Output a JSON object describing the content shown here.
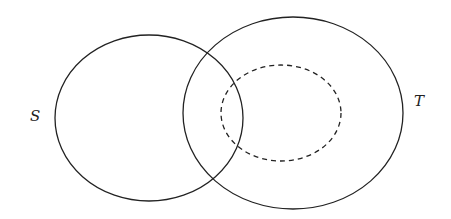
{
  "diagram": {
    "type": "venn",
    "sets": [
      {
        "id": "S",
        "label": "S",
        "style": "solid",
        "cx": 149,
        "cy": 118,
        "rx": 94,
        "ry": 83
      },
      {
        "id": "T",
        "label": "T",
        "style": "solid",
        "cx": 293,
        "cy": 113,
        "rx": 110,
        "ry": 96
      },
      {
        "id": "inner",
        "label": "",
        "style": "dashed",
        "cx": 281,
        "cy": 113,
        "rx": 60,
        "ry": 48
      }
    ],
    "labels": {
      "s": "S",
      "t": "T"
    },
    "stroke_color": "#222222"
  }
}
